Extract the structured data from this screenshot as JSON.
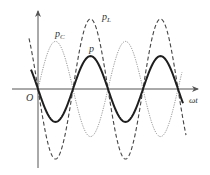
{
  "figure": {
    "labels": {
      "origin": "O",
      "x_axis": "ωt",
      "p": "p",
      "p_L_main": "p",
      "p_L_sub": "L",
      "p_C_main": "p",
      "p_C_sub": "C"
    },
    "colors": {
      "axis": "#555555",
      "p": "#222222",
      "p_L": "#444444",
      "p_C": "#888888",
      "label": "#333333"
    }
  },
  "chart_data": {
    "type": "line",
    "title": "",
    "xlabel": "ωt",
    "ylabel": "",
    "origin_label": "O",
    "grid": false,
    "legend": "inline labels near curves",
    "x_units": "half-periods (π)",
    "x_range": [
      -0.25,
      4.2
    ],
    "series": [
      {
        "name": "p_L",
        "style": "dashed",
        "function": "-A_L·sin(ωt)",
        "amplitude_rel": 1.0,
        "x": [
          0,
          0.5,
          1,
          1.5,
          2,
          2.5,
          3,
          3.5,
          4
        ],
        "values": [
          0,
          -1.0,
          0,
          1.0,
          0,
          -1.0,
          0,
          1.0,
          0
        ]
      },
      {
        "name": "p_C",
        "style": "dotted/thin",
        "function": "A_C·sin(ωt)",
        "amplitude_rel": 0.68,
        "x": [
          0,
          0.5,
          1,
          1.5,
          2,
          2.5,
          3,
          3.5,
          4
        ],
        "values": [
          0,
          0.68,
          0,
          -0.68,
          0,
          0.68,
          0,
          -0.68,
          0
        ]
      },
      {
        "name": "p",
        "style": "solid bold",
        "function": "p_L + p_C",
        "amplitude_rel": 0.47,
        "x": [
          0,
          0.5,
          1,
          1.5,
          2,
          2.5,
          3,
          3.5,
          4
        ],
        "values": [
          0,
          -0.47,
          0,
          0.47,
          0,
          -0.47,
          0,
          0.47,
          0
        ]
      }
    ]
  }
}
